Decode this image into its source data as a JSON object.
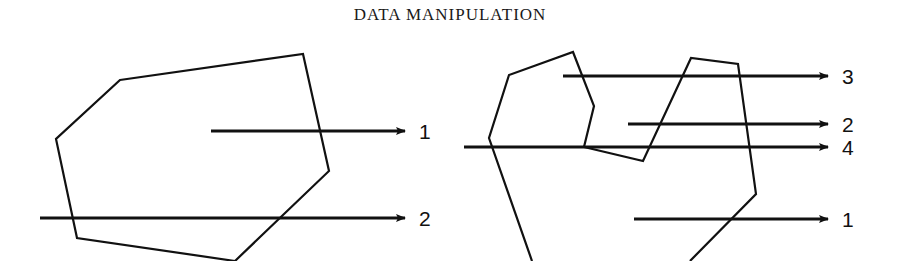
{
  "page": {
    "title": "DATA MANIPULATION"
  },
  "figure_left": {
    "polygon": "120,80 303,54 329,171 235,261 77,238 56,139",
    "rays": [
      {
        "label": "1",
        "y": 131,
        "x_start": 211,
        "x_end": 405
      },
      {
        "label": "2",
        "y": 218,
        "x_start": 40,
        "x_end": 405
      }
    ]
  },
  "figure_right": {
    "polygon": "532,261 489,138 509,75 573,52 594,106 584,147 643,161 691,58 738,64 756,194 690,261",
    "rays": [
      {
        "label": "3",
        "y": 76,
        "x_start": 563,
        "x_end": 828
      },
      {
        "label": "2",
        "y": 124,
        "x_start": 628,
        "x_end": 828
      },
      {
        "label": "4",
        "y": 147,
        "x_start": 464,
        "x_end": 828
      },
      {
        "label": "1",
        "y": 219,
        "x_start": 634,
        "x_end": 828
      }
    ]
  },
  "colors": {
    "ink": "#111111",
    "background": "#ffffff"
  }
}
